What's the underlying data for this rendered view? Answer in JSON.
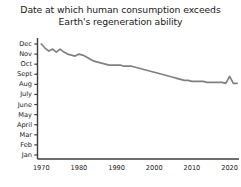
{
  "chart_data": {
    "type": "line",
    "title": "Date at which human consumption exceeds\nEarth's regeneration ability",
    "title_line1": "Date at which human consumption exceeds",
    "title_line2": "Earth's regeneration ability",
    "xlabel": "",
    "ylabel": "",
    "xlim": [
      1969,
      2022.5
    ],
    "ylim": [
      1,
      12
    ],
    "grid": false,
    "legend": false,
    "line_color": "#808080",
    "axis_color": "#3c3c3c",
    "background_color": "#ffffff",
    "text_color": "#1a1a1a",
    "x_tick_labels": [
      "1970",
      "1980",
      "1990",
      "2000",
      "2010",
      "2020"
    ],
    "x_tick_values": [
      1970,
      1980,
      1990,
      2000,
      2010,
      2020
    ],
    "y_tick_labels": [
      "Jan",
      "Feb",
      "Mar",
      "April",
      "May",
      "June",
      "July",
      "Aug",
      "Sept",
      "Oct",
      "Nov",
      "Dec"
    ],
    "y_tick_values": [
      1,
      2,
      3,
      4,
      5,
      6,
      7,
      8,
      9,
      10,
      11,
      12
    ],
    "y_tick_labels_top_to_bottom": [
      "Dec",
      "Nov",
      "Oct",
      "Sept",
      "Aug",
      "July",
      "June",
      "May",
      "April",
      "Mar",
      "Feb",
      "Jan"
    ],
    "x": [
      1970,
      1971,
      1972,
      1973,
      1974,
      1975,
      1976,
      1977,
      1978,
      1979,
      1980,
      1981,
      1982,
      1983,
      1984,
      1985,
      1986,
      1987,
      1988,
      1989,
      1990,
      1991,
      1992,
      1993,
      1994,
      1995,
      1996,
      1997,
      1998,
      1999,
      2000,
      2001,
      2002,
      2003,
      2004,
      2005,
      2006,
      2007,
      2008,
      2009,
      2010,
      2011,
      2012,
      2013,
      2014,
      2015,
      2016,
      2017,
      2018,
      2019,
      2020,
      2021,
      2022
    ],
    "values": [
      12.0,
      11.6,
      11.3,
      11.5,
      11.2,
      11.5,
      11.2,
      11.0,
      10.9,
      10.8,
      11.0,
      10.9,
      10.7,
      10.5,
      10.3,
      10.2,
      10.1,
      10.0,
      9.9,
      9.9,
      9.9,
      9.9,
      9.8,
      9.8,
      9.8,
      9.7,
      9.6,
      9.5,
      9.4,
      9.3,
      9.2,
      9.1,
      9.0,
      8.9,
      8.8,
      8.7,
      8.6,
      8.5,
      8.4,
      8.4,
      8.3,
      8.3,
      8.3,
      8.3,
      8.2,
      8.2,
      8.2,
      8.2,
      8.2,
      8.1,
      8.8,
      8.1,
      8.1
    ],
    "series": [
      {
        "name": "Overshoot date",
        "values": [
          12.0,
          11.6,
          11.3,
          11.5,
          11.2,
          11.5,
          11.2,
          11.0,
          10.9,
          10.8,
          11.0,
          10.9,
          10.7,
          10.5,
          10.3,
          10.2,
          10.1,
          10.0,
          9.9,
          9.9,
          9.9,
          9.9,
          9.8,
          9.8,
          9.8,
          9.7,
          9.6,
          9.5,
          9.4,
          9.3,
          9.2,
          9.1,
          9.0,
          8.9,
          8.8,
          8.7,
          8.6,
          8.5,
          8.4,
          8.4,
          8.3,
          8.3,
          8.3,
          8.3,
          8.2,
          8.2,
          8.2,
          8.2,
          8.2,
          8.1,
          8.8,
          8.1,
          8.1
        ]
      }
    ]
  }
}
